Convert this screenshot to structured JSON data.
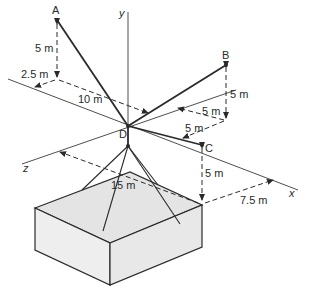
{
  "figure": {
    "type": "3D statics diagram: cables from point D to anchors A, B, C and a pyramid rig lifting a box",
    "points": {
      "A": "A",
      "B": "B",
      "C": "C",
      "D": "D"
    },
    "axes": {
      "x": "x",
      "y": "y",
      "z": "z"
    },
    "dimensions": {
      "A_height": "5 m",
      "A_z_offset": "2.5 m",
      "A_x_offset": "10 m",
      "B_height": "5 m",
      "B_x_offset": "5 m",
      "B_z_offset": "5 m",
      "C_depth": "5 m",
      "box_z_offset": "15 m",
      "box_x_offset": "7.5 m"
    },
    "colors": {
      "line": "#2a2a2a",
      "box_top": "#e4e4e4",
      "box_left": "#eeeeee",
      "box_right": "#e8e8e8",
      "background": "#ffffff"
    }
  }
}
